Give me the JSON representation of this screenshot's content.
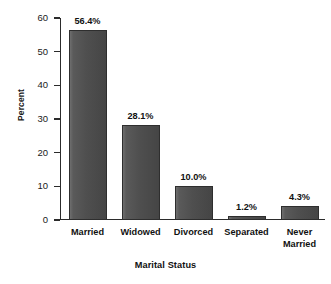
{
  "chart_data": {
    "type": "bar",
    "title": "",
    "xlabel": "Marital Status",
    "ylabel": "Percent",
    "categories": [
      "Married",
      "Widowed",
      "Divorced",
      "Separated",
      "Never Married"
    ],
    "category_lines": [
      [
        "Married"
      ],
      [
        "Widowed"
      ],
      [
        "Divorced"
      ],
      [
        "Separated"
      ],
      [
        "Never",
        "Married"
      ]
    ],
    "values": [
      56.4,
      28.1,
      10.0,
      1.2,
      4.3
    ],
    "data_labels": [
      "56.4%",
      "28.1%",
      "10.0%",
      "1.2%",
      "4.3%"
    ],
    "ylim": [
      0,
      60
    ],
    "ytick_values": [
      0,
      10,
      20,
      30,
      40,
      50,
      60
    ],
    "ytick_labels": [
      "0",
      "10",
      "20",
      "30",
      "40",
      "50",
      "60"
    ],
    "grid": false,
    "legend": false,
    "legend_position": "none",
    "bar_color": "#4f4f4f",
    "bar_edge_color": "#2e2e2e",
    "axis_color": "#2b2b2b",
    "text_color": "#111111",
    "background_color": "#ffffff"
  }
}
